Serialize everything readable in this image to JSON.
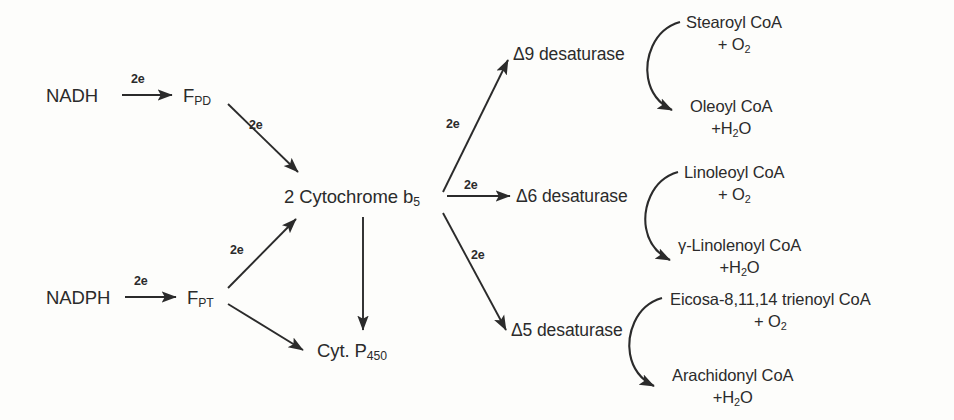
{
  "diagram": {
    "ink_color": "#2b2b2b",
    "background_color": "#fdfdfb",
    "electron_label": "2e",
    "donors": [
      {
        "id": "nadh",
        "label": "NADH",
        "flavoprotein": "F",
        "flavoprotein_sub": "PD"
      },
      {
        "id": "nadph",
        "label": "NADPH",
        "flavoprotein": "F",
        "flavoprotein_sub": "PT"
      }
    ],
    "hub": {
      "prefix": "2 Cytochrome b",
      "sub": "5"
    },
    "cyt_p450": {
      "label": "Cyt. P",
      "sub": "450"
    },
    "branches": [
      {
        "id": "delta9",
        "enzyme": "Δ9 desaturase",
        "substrate": "Stearoyl CoA",
        "substrate_cosub_plus": "+",
        "substrate_cosub": "O",
        "substrate_cosub_sub": "2",
        "product": "Oleoyl CoA",
        "product_coprod": "+H",
        "product_coprod_sub": "2",
        "product_coprod_tail": "O"
      },
      {
        "id": "delta6",
        "enzyme": "Δ6 desaturase",
        "substrate": "Linoleoyl CoA",
        "substrate_cosub_plus": "+",
        "substrate_cosub": "O",
        "substrate_cosub_sub": "2",
        "product": "γ-Linolenoyl CoA",
        "product_coprod": "+H",
        "product_coprod_sub": "2",
        "product_coprod_tail": "O"
      },
      {
        "id": "delta5",
        "enzyme": "Δ5 desaturase",
        "substrate": "Eicosa-8,11,14  trienoyl CoA",
        "substrate_cosub_plus": "+",
        "substrate_cosub": "O",
        "substrate_cosub_sub": "2",
        "product": "Arachidonyl CoA",
        "product_coprod": "+H",
        "product_coprod_sub": "2",
        "product_coprod_tail": "O"
      }
    ],
    "electron_labels": {
      "nadh_to_fpd": "2e",
      "nadph_to_fpt": "2e",
      "fpd_to_hub": "2e",
      "fpt_to_hub": "2e",
      "hub_to_delta9": "2e",
      "hub_to_delta6": "2e",
      "hub_to_delta5": "2e"
    }
  }
}
